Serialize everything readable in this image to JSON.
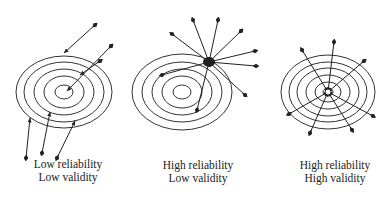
{
  "figure": {
    "panels": [
      {
        "id": "low-rel-low-val",
        "caption_line1": "Low reliability",
        "caption_line2": "Low validity",
        "center": [
          64,
          92
        ],
        "ring_radii": [
          [
            9,
            7
          ],
          [
            20,
            16
          ],
          [
            30,
            23
          ],
          [
            40,
            30
          ],
          [
            48,
            36
          ]
        ],
        "arrows": [
          {
            "from": [
              95,
              25
            ],
            "to": [
              64,
              53
            ]
          },
          {
            "from": [
              111,
              46
            ],
            "to": [
              67,
              91
            ]
          },
          {
            "from": [
              100,
              61
            ],
            "to": [
              80,
              75
            ]
          },
          {
            "from": [
              26,
              158
            ],
            "to": [
              30,
              118
            ]
          },
          {
            "from": [
              42,
              153
            ],
            "to": [
              50,
              112
            ]
          },
          {
            "from": [
              57,
              158
            ],
            "to": [
              75,
              121
            ]
          }
        ]
      },
      {
        "id": "high-rel-low-val",
        "caption_line1": "High reliability",
        "caption_line2": "Low validity",
        "center": [
          182,
          92
        ],
        "ring_radii": [
          [
            9,
            7
          ],
          [
            20,
            16
          ],
          [
            30,
            23
          ],
          [
            40,
            30
          ],
          [
            50,
            38
          ]
        ],
        "cluster": [
          209,
          62
        ],
        "arrows": [
          {
            "from": [
              209,
              62
            ],
            "to": [
              193,
              20
            ]
          },
          {
            "from": [
              209,
              62
            ],
            "to": [
              218,
              20
            ]
          },
          {
            "from": [
              209,
              62
            ],
            "to": [
              241,
              31
            ]
          },
          {
            "from": [
              209,
              62
            ],
            "to": [
              255,
              51
            ]
          },
          {
            "from": [
              209,
              62
            ],
            "to": [
              256,
              66
            ]
          },
          {
            "from": [
              209,
              62
            ],
            "to": [
              245,
              95
            ]
          },
          {
            "from": [
              209,
              62
            ],
            "to": [
              172,
              34
            ]
          },
          {
            "from": [
              209,
              62
            ],
            "to": [
              162,
              75
            ]
          },
          {
            "from": [
              209,
              62
            ],
            "to": [
              197,
              110
            ]
          }
        ]
      },
      {
        "id": "high-rel-high-val",
        "caption_line1": "High reliability",
        "caption_line2": "High validity",
        "center": [
          328,
          92
        ],
        "ring_radii": [
          [
            5,
            4
          ],
          [
            13,
            10
          ],
          [
            22,
            17
          ],
          [
            31,
            24
          ],
          [
            39,
            30
          ],
          [
            47,
            37
          ]
        ],
        "arrows": [
          {
            "from": [
              328,
              92
            ],
            "to": [
              334,
              42
            ]
          },
          {
            "from": [
              328,
              92
            ],
            "to": [
              364,
              61
            ]
          },
          {
            "from": [
              328,
              92
            ],
            "to": [
              373,
              116
            ]
          },
          {
            "from": [
              328,
              92
            ],
            "to": [
              352,
              130
            ]
          },
          {
            "from": [
              328,
              92
            ],
            "to": [
              310,
              133
            ]
          },
          {
            "from": [
              328,
              92
            ],
            "to": [
              289,
              114
            ]
          },
          {
            "from": [
              328,
              92
            ],
            "to": [
              302,
              50
            ]
          }
        ]
      }
    ]
  }
}
